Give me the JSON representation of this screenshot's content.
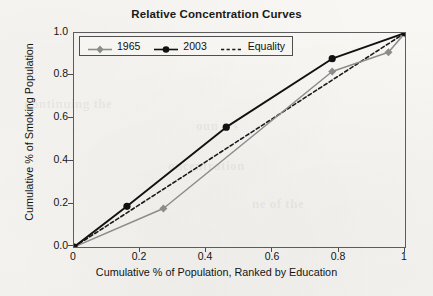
{
  "chart_data": {
    "type": "line",
    "title": "Relative Concentration Curves",
    "xlabel": "Cumulative % of Population, Ranked by Education",
    "ylabel": "Cumulative % of Smoking Population",
    "xlim": [
      0,
      1
    ],
    "ylim": [
      0,
      1
    ],
    "xticks": [
      "0",
      "0.2",
      "0.4",
      "0.6",
      "0.8",
      "1"
    ],
    "xtick_values": [
      0,
      0.2,
      0.4,
      0.6,
      0.8,
      1
    ],
    "yticks": [
      "0.0",
      "0.2",
      "0.4",
      "0.6",
      "0.8",
      "1.0"
    ],
    "ytick_values": [
      0,
      0.2,
      0.4,
      0.6,
      0.8,
      1
    ],
    "grid": false,
    "legend_position": "top-left inside",
    "series": [
      {
        "name": "1965",
        "marker": "diamond",
        "color": "#8c8c8c",
        "line_style": "solid",
        "x": [
          0,
          0.27,
          0.78,
          0.95,
          1
        ],
        "y": [
          0,
          0.18,
          0.82,
          0.91,
          1
        ]
      },
      {
        "name": "2003",
        "marker": "circle",
        "color": "#111111",
        "line_style": "solid",
        "x": [
          0,
          0.16,
          0.46,
          0.78,
          1
        ],
        "y": [
          0,
          0.19,
          0.56,
          0.88,
          1
        ]
      },
      {
        "name": "Equality",
        "marker": "none",
        "color": "#1a1a1a",
        "line_style": "dashed",
        "x": [
          0,
          1
        ],
        "y": [
          0,
          1
        ]
      }
    ]
  },
  "legend": {
    "items": [
      {
        "label": "1965"
      },
      {
        "label": "2003"
      },
      {
        "label": "Equality"
      }
    ]
  },
  "colors": {
    "series_1965": "#8c8c8c",
    "series_2003": "#111111",
    "equality": "#1a1a1a",
    "axis": "#5c5c5c",
    "page": "#f7f6f3"
  },
  "ghost_text": {
    "line1": "nontinuing the",
    "line2": "oun tes",
    "line3": "oncentration",
    "line4": "ne of the"
  }
}
